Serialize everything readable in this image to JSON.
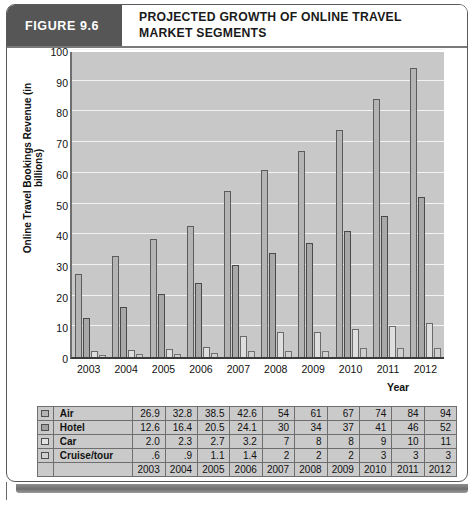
{
  "figure": {
    "tag": "FIGURE 9.6",
    "title": "PROJECTED GROWTH OF ONLINE TRAVEL MARKET SEGMENTS"
  },
  "chart_data": {
    "type": "bar",
    "title": "PROJECTED GROWTH OF ONLINE TRAVEL MARKET SEGMENTS",
    "xlabel": "Year",
    "ylabel": "Online Travel Bookings Revenue (in billions)",
    "ylim": [
      0,
      100
    ],
    "yticks": [
      0,
      10,
      20,
      30,
      40,
      50,
      60,
      70,
      80,
      90,
      100
    ],
    "grid": true,
    "legend_position": "table-left",
    "categories": [
      "2003",
      "2004",
      "2005",
      "2006",
      "2007",
      "2008",
      "2009",
      "2010",
      "2011",
      "2012"
    ],
    "series": [
      {
        "name": "Air",
        "values": [
          26.9,
          32.8,
          38.5,
          42.6,
          54,
          61,
          67,
          74,
          84,
          94
        ],
        "labels": [
          "26.9",
          "32.8",
          "38.5",
          "42.6",
          "54",
          "61",
          "67",
          "74",
          "84",
          "94"
        ]
      },
      {
        "name": "Hotel",
        "values": [
          12.6,
          16.4,
          20.5,
          24.1,
          30,
          34,
          37,
          41,
          46,
          52
        ],
        "labels": [
          "12.6",
          "16.4",
          "20.5",
          "24.1",
          "30",
          "34",
          "37",
          "41",
          "46",
          "52"
        ]
      },
      {
        "name": "Car",
        "values": [
          2.0,
          2.3,
          2.7,
          3.2,
          7,
          8,
          8,
          9,
          10,
          11
        ],
        "labels": [
          "2.0",
          "2.3",
          "2.7",
          "3.2",
          "7",
          "8",
          "8",
          "9",
          "10",
          "11"
        ]
      },
      {
        "name": "Cruise/tour",
        "values": [
          0.6,
          0.9,
          1.1,
          1.4,
          2,
          2,
          2,
          3,
          3,
          3
        ],
        "labels": [
          ".6",
          ".9",
          "1.1",
          "1.4",
          "2",
          "2",
          "2",
          "3",
          "3",
          "3"
        ]
      }
    ]
  },
  "colors": {
    "figure_tag_bg": "#565656",
    "plot_bg": "#c8c8c8",
    "gridline": "#f2f2f2",
    "table_bg": "#cacaca",
    "series": [
      "#b4b4b4",
      "#a8a8a8",
      "#dedede",
      "#cfcfcf"
    ]
  }
}
